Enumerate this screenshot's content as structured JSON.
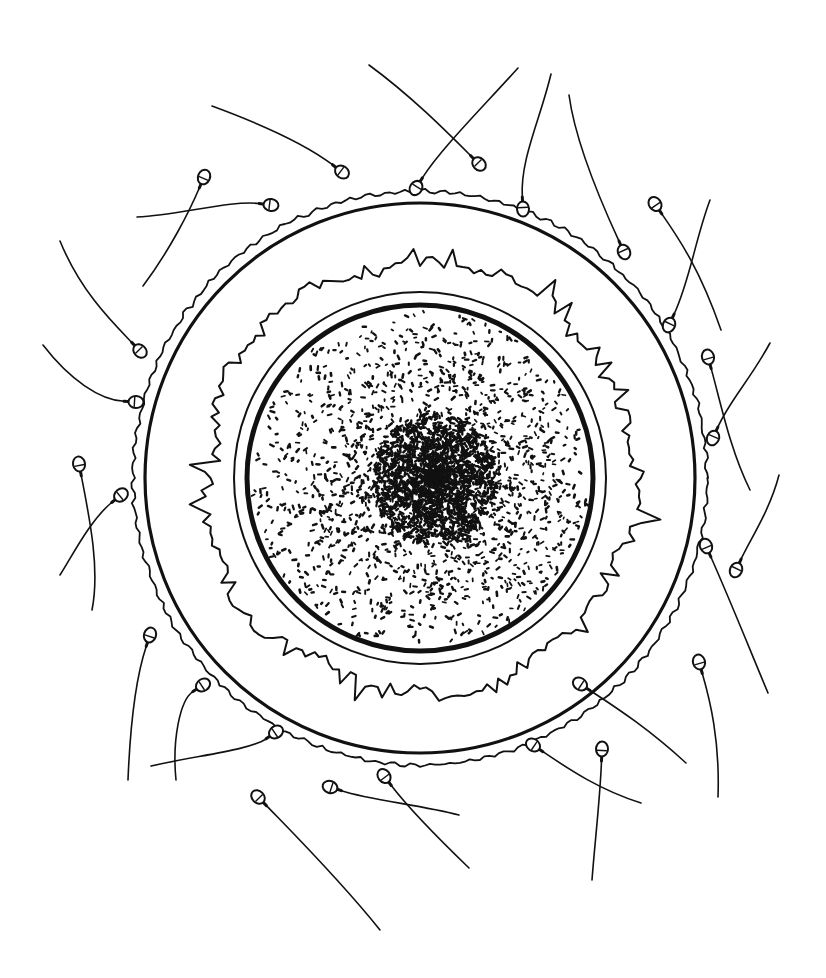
{
  "figure": {
    "title": "",
    "background": "#ffffff",
    "ink_color": "#111111",
    "center": {
      "x": 420,
      "y": 478
    },
    "layers": [
      {
        "name": "outer-wavy-edge",
        "radius": 287
      },
      {
        "name": "outer-ring",
        "radius": 275
      },
      {
        "name": "jagged-layer",
        "radius_min": 198,
        "radius_max": 232
      },
      {
        "name": "thin-ring",
        "radius": 186
      },
      {
        "name": "thick-membrane",
        "radius": 173
      },
      {
        "name": "cytoplasm-speckle",
        "radius": 168
      },
      {
        "name": "dense-core",
        "cx": 435,
        "cy": 478,
        "radius": 62
      }
    ],
    "sperm": [
      {
        "hx": 342,
        "hy": 172,
        "tail": [
          [
            300,
            140
          ],
          [
            250,
            120
          ],
          [
            212,
            106
          ]
        ]
      },
      {
        "hx": 479,
        "hy": 164,
        "tail": [
          [
            445,
            130
          ],
          [
            410,
            95
          ],
          [
            369,
            65
          ]
        ]
      },
      {
        "hx": 416,
        "hy": 188,
        "tail": [
          [
            440,
            150
          ],
          [
            480,
            110
          ],
          [
            518,
            68
          ]
        ]
      },
      {
        "hx": 523,
        "hy": 209,
        "tail": [
          [
            520,
            160
          ],
          [
            540,
            120
          ],
          [
            551,
            74
          ]
        ]
      },
      {
        "hx": 624,
        "hy": 252,
        "tail": [
          [
            600,
            200
          ],
          [
            575,
            140
          ],
          [
            569,
            95
          ]
        ]
      },
      {
        "hx": 204,
        "hy": 177,
        "tail": [
          [
            190,
            210
          ],
          [
            170,
            250
          ],
          [
            143,
            286
          ]
        ]
      },
      {
        "hx": 271,
        "hy": 205,
        "tail": [
          [
            230,
            200
          ],
          [
            180,
            215
          ],
          [
            137,
            217
          ]
        ]
      },
      {
        "hx": 655,
        "hy": 204,
        "tail": [
          [
            680,
            240
          ],
          [
            700,
            270
          ],
          [
            721,
            330
          ]
        ]
      },
      {
        "hx": 669,
        "hy": 325,
        "tail": [
          [
            690,
            280
          ],
          [
            695,
            240
          ],
          [
            710,
            200
          ]
        ]
      },
      {
        "hx": 140,
        "hy": 351,
        "tail": [
          [
            110,
            320
          ],
          [
            80,
            290
          ],
          [
            60,
            241
          ]
        ]
      },
      {
        "hx": 136,
        "hy": 402,
        "tail": [
          [
            100,
            400
          ],
          [
            70,
            380
          ],
          [
            43,
            345
          ]
        ]
      },
      {
        "hx": 708,
        "hy": 357,
        "tail": [
          [
            720,
            400
          ],
          [
            730,
            450
          ],
          [
            750,
            490
          ]
        ]
      },
      {
        "hx": 713,
        "hy": 438,
        "tail": [
          [
            730,
            400
          ],
          [
            750,
            380
          ],
          [
            770,
            343
          ]
        ]
      },
      {
        "hx": 79,
        "hy": 464,
        "tail": [
          [
            90,
            520
          ],
          [
            100,
            570
          ],
          [
            92,
            610
          ]
        ]
      },
      {
        "hx": 121,
        "hy": 495,
        "tail": [
          [
            90,
            520
          ],
          [
            70,
            560
          ],
          [
            60,
            575
          ]
        ]
      },
      {
        "hx": 706,
        "hy": 546,
        "tail": [
          [
            730,
            600
          ],
          [
            750,
            650
          ],
          [
            768,
            693
          ]
        ]
      },
      {
        "hx": 736,
        "hy": 570,
        "tail": [
          [
            750,
            540
          ],
          [
            770,
            510
          ],
          [
            779,
            475
          ]
        ]
      },
      {
        "hx": 150,
        "hy": 635,
        "tail": [
          [
            135,
            680
          ],
          [
            130,
            730
          ],
          [
            128,
            780
          ]
        ]
      },
      {
        "hx": 203,
        "hy": 685,
        "tail": [
          [
            180,
            700
          ],
          [
            172,
            740
          ],
          [
            176,
            780
          ]
        ]
      },
      {
        "hx": 276,
        "hy": 732,
        "tail": [
          [
            250,
            750
          ],
          [
            200,
            755
          ],
          [
            151,
            766
          ]
        ]
      },
      {
        "hx": 699,
        "hy": 662,
        "tail": [
          [
            710,
            700
          ],
          [
            720,
            740
          ],
          [
            718,
            797
          ]
        ]
      },
      {
        "hx": 580,
        "hy": 684,
        "tail": [
          [
            620,
            710
          ],
          [
            650,
            730
          ],
          [
            686,
            763
          ]
        ]
      },
      {
        "hx": 533,
        "hy": 745,
        "tail": [
          [
            570,
            770
          ],
          [
            600,
            790
          ],
          [
            641,
            803
          ]
        ]
      },
      {
        "hx": 602,
        "hy": 749,
        "tail": [
          [
            600,
            800
          ],
          [
            595,
            840
          ],
          [
            592,
            880
          ]
        ]
      },
      {
        "hx": 258,
        "hy": 797,
        "tail": [
          [
            290,
            830
          ],
          [
            340,
            880
          ],
          [
            380,
            930
          ]
        ]
      },
      {
        "hx": 330,
        "hy": 787,
        "tail": [
          [
            370,
            800
          ],
          [
            420,
            805
          ],
          [
            459,
            815
          ]
        ]
      },
      {
        "hx": 384,
        "hy": 776,
        "tail": [
          [
            410,
            810
          ],
          [
            440,
            840
          ],
          [
            469,
            868
          ]
        ]
      }
    ]
  }
}
